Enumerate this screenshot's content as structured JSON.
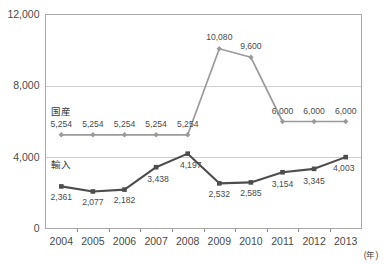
{
  "chart_data": {
    "type": "line",
    "title": "",
    "xlabel": "(年)",
    "ylabel": "",
    "categories": [
      "2004",
      "2005",
      "2006",
      "2007",
      "2008",
      "2009",
      "2010",
      "2011",
      "2012",
      "2013"
    ],
    "ylim": [
      0,
      12000
    ],
    "yticks": [
      0,
      4000,
      8000,
      12000
    ],
    "ytick_labels": [
      "0",
      "4,000",
      "8,000",
      "12,000"
    ],
    "grid": true,
    "legend_position": "inline-left",
    "series": [
      {
        "name": "国産",
        "color": "#9a9a9a",
        "marker": "diamond",
        "values": [
          5254,
          5254,
          5254,
          5254,
          5254,
          10080,
          9600,
          6000,
          6000,
          6000
        ],
        "labels": [
          "5,254",
          "5,254",
          "5,254",
          "5,254",
          "5,254",
          "10,080",
          "9,600",
          "6,000",
          "6,000",
          "6,000"
        ]
      },
      {
        "name": "輸入",
        "color": "#4d4d4d",
        "marker": "square",
        "values": [
          2361,
          2077,
          2182,
          3438,
          4197,
          2532,
          2585,
          3154,
          3345,
          4003
        ],
        "labels": [
          "2,361",
          "2,077",
          "2,182",
          "3,438",
          "4,197",
          "2,532",
          "2,585",
          "3,154",
          "3,345",
          "4,003"
        ]
      }
    ]
  }
}
